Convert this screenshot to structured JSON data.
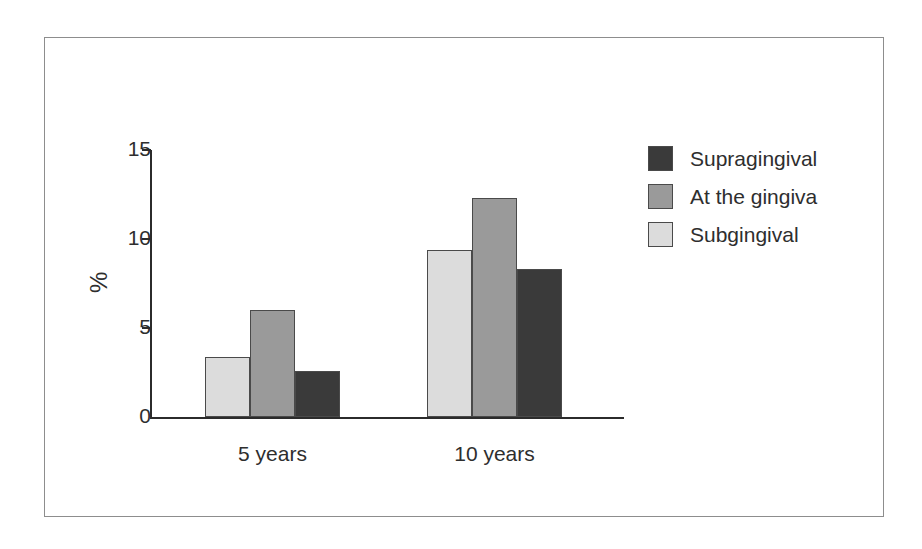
{
  "chart_data": {
    "type": "bar",
    "title": "",
    "xlabel": "",
    "ylabel": "%",
    "categories": [
      "5 years",
      "10 years"
    ],
    "ylim": [
      0,
      15
    ],
    "yticks": [
      0,
      5,
      10,
      15
    ],
    "ytick_labels": [
      "0",
      "5",
      "10",
      "15"
    ],
    "grid": false,
    "legend_position": "right",
    "series": [
      {
        "name": "Subgingival",
        "color": "#dcdcdc",
        "values": [
          3.35,
          9.4
        ]
      },
      {
        "name": "At the gingiva",
        "color": "#9a9a9a",
        "values": [
          6.0,
          12.3
        ]
      },
      {
        "name": "Supragingival",
        "color": "#3a3a3a",
        "values": [
          2.6,
          8.3
        ]
      }
    ],
    "series_draw_order": [
      "Subgingival",
      "At the gingiva",
      "Supragingival"
    ],
    "legend_order": [
      "Supragingival",
      "At the gingiva",
      "Subgingival"
    ]
  },
  "axis": {
    "y_title": "%",
    "ticks": [
      {
        "label": "15",
        "value": 15
      },
      {
        "label": "10",
        "value": 10
      },
      {
        "label": "5",
        "value": 5
      },
      {
        "label": "0",
        "value": 0
      }
    ]
  },
  "groups": [
    {
      "label": "5 years"
    },
    {
      "label": "10 years"
    }
  ],
  "legend": {
    "items": [
      {
        "label": "Supragingival",
        "color": "#3a3a3a"
      },
      {
        "label": "At the gingiva",
        "color": "#9a9a9a"
      },
      {
        "label": "Subgingival",
        "color": "#dcdcdc"
      }
    ]
  },
  "colors": {
    "supragingival": "#3a3a3a",
    "at_the_gingiva": "#9a9a9a",
    "subgingival": "#dcdcdc",
    "axis": "#2b2b2b",
    "frame": "#8d8d8d",
    "text": "#2e2e2e",
    "background": "#ffffff"
  }
}
